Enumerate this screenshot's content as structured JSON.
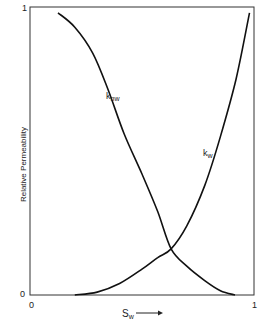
{
  "chart_data": {
    "type": "line",
    "title": "",
    "xlabel": "S_w",
    "xlabel_main": "S",
    "xlabel_sub": "w",
    "xlabel_arrow": "→",
    "ylabel": "Relative Permeability",
    "xlim": [
      0,
      1
    ],
    "ylim": [
      0,
      1
    ],
    "x_ticks": [
      "0",
      "1"
    ],
    "y_ticks": [
      "0",
      "1"
    ],
    "grid": false,
    "legend": "none (inline curve labels)",
    "series": [
      {
        "name": "k_nw",
        "label_main": "k",
        "label_sub": "nw",
        "x": [
          0.125,
          0.2,
          0.28,
          0.35,
          0.42,
          0.5,
          0.57,
          0.63,
          0.7,
          0.78,
          0.85,
          0.915
        ],
        "y": [
          0.98,
          0.93,
          0.84,
          0.71,
          0.56,
          0.42,
          0.29,
          0.16,
          0.1,
          0.05,
          0.015,
          0.0
        ]
      },
      {
        "name": "k_w",
        "label_main": "k",
        "label_sub": "w",
        "x": [
          0.2,
          0.3,
          0.4,
          0.5,
          0.57,
          0.63,
          0.7,
          0.78,
          0.85,
          0.92,
          0.98
        ],
        "y": [
          0.0,
          0.01,
          0.04,
          0.09,
          0.13,
          0.16,
          0.24,
          0.38,
          0.55,
          0.75,
          0.98
        ]
      }
    ]
  }
}
